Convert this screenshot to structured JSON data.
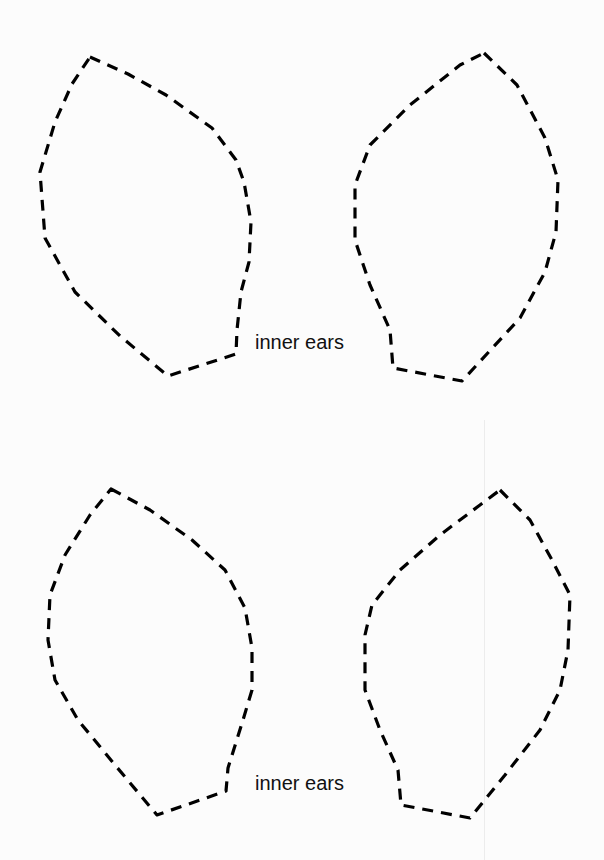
{
  "page": {
    "background": "#fcfcfc",
    "stroke_color": "#000000"
  },
  "templates": [
    {
      "id": "top-pair",
      "label": "inner ears",
      "label_pos": {
        "x": 255,
        "y": 330
      },
      "shapes": [
        {
          "name": "left-inner-ear-top",
          "points": "90,57 128,74 166,95 212,128 236,160 244,182 251,222 249,262 241,292 237,330 236,354 168,376 120,336 75,292 45,238 40,172 55,122 72,84 90,57"
        },
        {
          "name": "right-inner-ear-top",
          "points": "484,53 517,85 545,138 558,180 556,232 545,272 520,318 462,381 393,368 390,330 370,285 355,240 355,185 370,145 410,105 460,65 484,53"
        }
      ]
    },
    {
      "id": "bottom-pair",
      "label": "inner ears",
      "label_pos": {
        "x": 255,
        "y": 771
      },
      "shapes": [
        {
          "name": "left-inner-ear-bottom",
          "points": "111,489 150,510 192,540 225,570 245,608 252,648 252,690 243,720 228,768 226,791 157,815 115,765 78,720 55,680 48,640 50,595 65,555 90,515 111,489"
        },
        {
          "name": "right-inner-ear-bottom",
          "points": "500,490 530,520 552,560 570,595 568,650 560,690 540,730 505,775 470,818 401,805 398,770 380,730 365,690 365,635 372,605 400,570 440,535 480,505 500,490"
        }
      ]
    }
  ]
}
